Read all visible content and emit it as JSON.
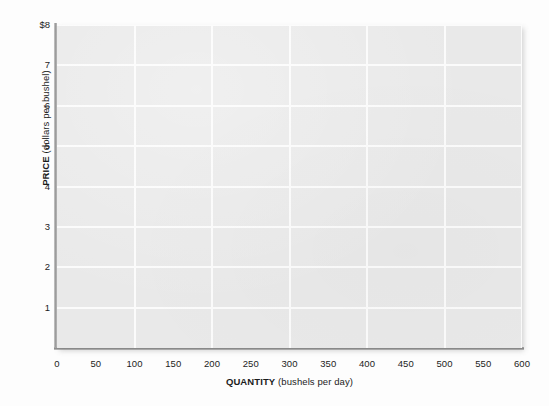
{
  "chart_data": {
    "type": "line",
    "title": "",
    "subtitle": "",
    "xlabel_bold": "QUANTITY",
    "xlabel_rest": "(bushels per day)",
    "ylabel_bold": "PRICE",
    "ylabel_rest": "(dollars per bushel)",
    "xlim": [
      0,
      600
    ],
    "ylim": [
      0,
      8
    ],
    "x_ticks": [
      0,
      50,
      100,
      150,
      200,
      250,
      300,
      350,
      400,
      450,
      500,
      550,
      600
    ],
    "x_tick_labels": [
      "0",
      "50",
      "100",
      "150",
      "200",
      "250",
      "300",
      "350",
      "400",
      "450",
      "500",
      "550",
      "600"
    ],
    "y_ticks": [
      0,
      1,
      2,
      3,
      4,
      5,
      6,
      7,
      8
    ],
    "y_tick_labels": [
      "0",
      "1",
      "2",
      "3",
      "4",
      "5",
      "6",
      "7",
      "$8"
    ],
    "y_tick_labels_shown": [
      "1",
      "2",
      "3",
      "4",
      "5",
      "6",
      "7",
      "$8"
    ],
    "grid": true,
    "grid_x_interval": 100,
    "grid_y_interval": 1,
    "grid_color": "#fbfbfb",
    "plot_background": "#e9e9e9",
    "page_background": "#fdfdfd",
    "axis_color": "#9a9a9a",
    "text_color": "#1c1c1c",
    "legend": null,
    "legend_position": "none",
    "series": [],
    "annotations": [],
    "note": "Empty supply-and-demand grid; no data series plotted"
  },
  "axes": {
    "y_title_bold": "PRICE",
    "y_title_rest": "(dollars per bushel)",
    "x_title_bold": "QUANTITY",
    "x_title_rest": "(bushels per day)"
  }
}
